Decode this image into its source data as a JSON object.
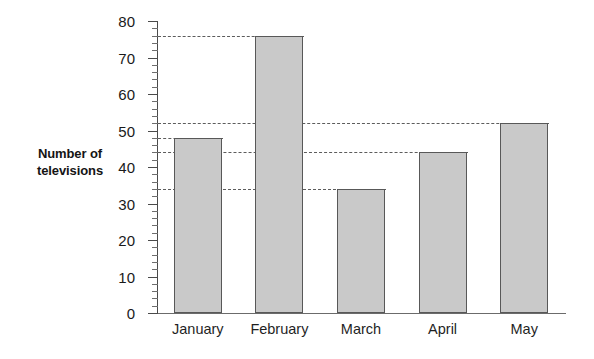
{
  "chart_data": {
    "type": "bar",
    "title": "",
    "subtitle": "",
    "xlabel": "",
    "ylabel": "Number of televisions",
    "ylabel_line1": "Number of",
    "ylabel_line2": "televisions",
    "categories": [
      "January",
      "February",
      "March",
      "April",
      "May"
    ],
    "values": [
      48,
      76,
      34,
      44,
      52
    ],
    "ylim": [
      0,
      80
    ],
    "ytick_labels": [
      "0",
      "10",
      "20",
      "30",
      "40",
      "50",
      "60",
      "70",
      "80"
    ],
    "ytick_values": [
      0,
      10,
      20,
      30,
      40,
      50,
      60,
      70,
      80
    ],
    "minor_tick_step": 2,
    "grid": false,
    "reference_lines": [
      76,
      52,
      48,
      44,
      34
    ],
    "legend": [],
    "legend_position": "none",
    "bar_fill_color": "#c9c9c9",
    "bar_edge_color": "#585858",
    "axis_color": "#4a4a4a",
    "reference_line_color": "#5c5c5c",
    "background_color": "#ffffff"
  }
}
